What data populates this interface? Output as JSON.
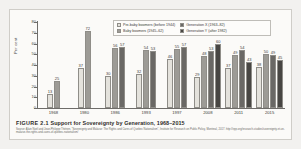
{
  "figure": {
    "number_label": "FIGURE 2.1",
    "caption": "Support for Sovereignty by Generation, 1968–2015",
    "source": "Source: Alain Noël and Jean-Philippe Thérien, “Sovereignty and Malaise: The Rights and Cares of Quebec Nationalism”, Institute for Research on Public Policy, Montreal, 2017. http://irpp.org/research-studies/sovereignty-et-un-malaise-the-rights-and-cares-of-quebec-nationalism/"
  },
  "legend": {
    "columns": [
      [
        {
          "label": "Pre-baby boomers (before 1944)",
          "color": "#e4e2dc",
          "name": "pre-baby-boomers"
        },
        {
          "label": "Baby boomers (1945–62)",
          "color": "#9d9b96",
          "name": "baby-boomers"
        }
      ],
      [
        {
          "label": "Generation X (1963–82)",
          "color": "#6a6865",
          "name": "generation-x"
        },
        {
          "label": "Generation Y (after 1982)",
          "color": "#484643",
          "name": "generation-y"
        }
      ]
    ]
  },
  "chart_data": {
    "type": "bar",
    "title": "Support for Sovereignty by Generation, 1968–2015",
    "xlabel": "",
    "ylabel": "Per cent",
    "ylim": [
      0,
      80
    ],
    "yticks": [
      0,
      10,
      20,
      30,
      40,
      50,
      60,
      70,
      80
    ],
    "grid": false,
    "legend_position": "top-right",
    "categories": [
      "1968",
      "1980",
      "1986",
      "1993",
      "1997",
      "2008",
      "2011",
      "2015"
    ],
    "series": [
      {
        "name": "Pre-baby boomers (before 1944)",
        "color": "#e4e2dc",
        "values": [
          13,
          37,
          30,
          32,
          46,
          29,
          37,
          38
        ]
      },
      {
        "name": "Baby boomers (1945–62)",
        "color": "#9d9b96",
        "values": [
          25,
          72,
          56,
          54,
          55,
          48,
          49,
          50
        ]
      },
      {
        "name": "Generation X (1963–82)",
        "color": "#6a6865",
        "values": [
          null,
          null,
          57,
          53,
          57,
          53,
          54,
          49
        ]
      },
      {
        "name": "Generation Y (after 1982)",
        "color": "#484643",
        "values": [
          null,
          null,
          null,
          null,
          null,
          60,
          43,
          45
        ]
      }
    ]
  }
}
